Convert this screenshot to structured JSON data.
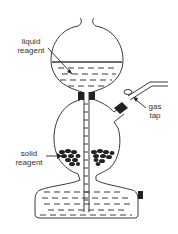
{
  "diagram": {
    "title": "",
    "labels": {
      "liquid_reagent": "liquid\nreagent",
      "gas_tap": "gas\ntap",
      "solid_reagent": "solid\nreagent"
    },
    "colors": {
      "line": "#3a3a3a",
      "fill": "#222222",
      "text": "#333333",
      "background": "#ffffff"
    }
  }
}
